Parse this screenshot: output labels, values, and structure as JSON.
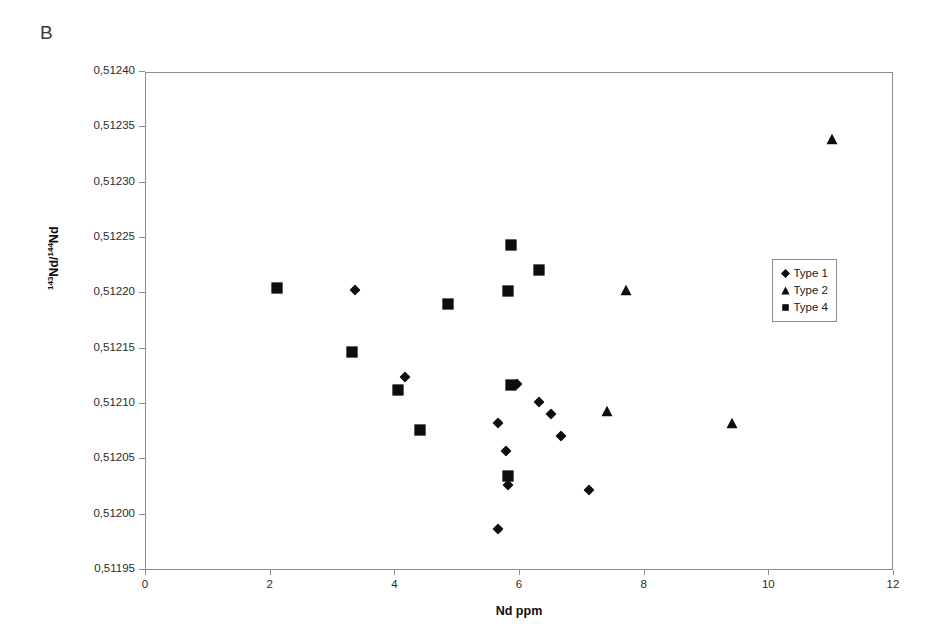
{
  "panel": {
    "label": "B"
  },
  "colors": {
    "marker": "#0d0d0d",
    "axis": "#8d8d8d",
    "frame": "#8d8d8d",
    "text": "#2b2b2b",
    "background": "#ffffff",
    "legend_border": "#8f8f8f"
  },
  "chart_data": {
    "type": "scatter",
    "title": "B",
    "xlabel": "Nd ppm",
    "ylabel": "143Nd/144Nd",
    "ylabel_parts": {
      "sup1": "143",
      "mid": "Nd/",
      "sup2": "144",
      "tail": "Nd"
    },
    "xlim": [
      0,
      12
    ],
    "ylim": [
      0.51195,
      0.5124
    ],
    "xticks": [
      0,
      2,
      4,
      6,
      8,
      10,
      12
    ],
    "xtick_labels": [
      "0",
      "2",
      "4",
      "6",
      "8",
      "10",
      "12"
    ],
    "yticks": [
      0.51195,
      0.512,
      0.51205,
      0.5121,
      0.51215,
      0.5122,
      0.51225,
      0.5123,
      0.51235,
      0.5124
    ],
    "ytick_labels": [
      "0,51195",
      "0,51200",
      "0,51205",
      "0,51210",
      "0,51215",
      "0,51220",
      "0,51225",
      "0,51230",
      "0,51235",
      "0,51240"
    ],
    "decimal_separator": ",",
    "grid": false,
    "legend_position": "right",
    "series": [
      {
        "name": "Type 1",
        "marker": "diamond",
        "color": "#0d0d0d",
        "points": [
          {
            "x": 3.35,
            "y": 0.512204
          },
          {
            "x": 4.15,
            "y": 0.512125
          },
          {
            "x": 5.95,
            "y": 0.512119
          },
          {
            "x": 5.65,
            "y": 0.512084
          },
          {
            "x": 6.3,
            "y": 0.512103
          },
          {
            "x": 6.5,
            "y": 0.512092
          },
          {
            "x": 6.65,
            "y": 0.512072
          },
          {
            "x": 5.78,
            "y": 0.512058
          },
          {
            "x": 5.8,
            "y": 0.512028
          },
          {
            "x": 7.1,
            "y": 0.512023
          },
          {
            "x": 5.65,
            "y": 0.511988
          }
        ]
      },
      {
        "name": "Type 2",
        "marker": "triangle",
        "color": "#0d0d0d",
        "points": [
          {
            "x": 11.0,
            "y": 0.51234
          },
          {
            "x": 7.7,
            "y": 0.512204
          },
          {
            "x": 7.4,
            "y": 0.512095
          },
          {
            "x": 9.4,
            "y": 0.512084
          }
        ]
      },
      {
        "name": "Type 4",
        "marker": "square",
        "color": "#0d0d0d",
        "points": [
          {
            "x": 2.1,
            "y": 0.512206
          },
          {
            "x": 3.3,
            "y": 0.512148
          },
          {
            "x": 4.05,
            "y": 0.512114
          },
          {
            "x": 4.4,
            "y": 0.512077
          },
          {
            "x": 4.85,
            "y": 0.512191
          },
          {
            "x": 5.8,
            "y": 0.512203
          },
          {
            "x": 5.85,
            "y": 0.512245
          },
          {
            "x": 6.3,
            "y": 0.512222
          },
          {
            "x": 5.85,
            "y": 0.512118
          },
          {
            "x": 5.8,
            "y": 0.512036
          }
        ]
      }
    ]
  },
  "legend": {
    "items": [
      {
        "label": "Type 1",
        "marker": "diamond"
      },
      {
        "label": "Type 2",
        "marker": "triangle"
      },
      {
        "label": "Type 4",
        "marker": "square"
      }
    ]
  }
}
